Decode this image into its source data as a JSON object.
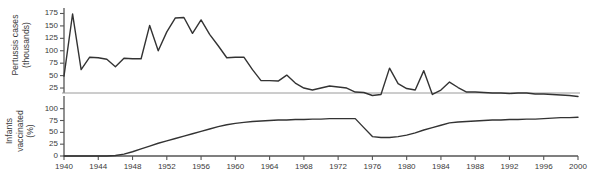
{
  "chart_data": {
    "type": "line",
    "title": "",
    "subtitle": "",
    "panels": [
      {
        "name": "pertussis-cases-panel",
        "ylabel_lines": [
          "Pertussis cases",
          "(thousands)"
        ],
        "ylabel": "Pertussis cases (thousands)",
        "yticks": [
          25,
          50,
          75,
          100,
          125,
          150,
          175
        ],
        "ytick_labels": [
          "25",
          "50",
          "75",
          "100",
          "125",
          "150",
          "175"
        ],
        "ylim": [
          15,
          180
        ],
        "grid": false,
        "series": [
          {
            "name": "Pertussis cases (thousands)",
            "x": [
              1940,
              1941,
              1942,
              1943,
              1944,
              1945,
              1946,
              1947,
              1948,
              1949,
              1950,
              1951,
              1952,
              1953,
              1954,
              1955,
              1956,
              1957,
              1958,
              1959,
              1960,
              1961,
              1962,
              1963,
              1964,
              1965,
              1966,
              1967,
              1968,
              1969,
              1970,
              1971,
              1972,
              1973,
              1974,
              1975,
              1976,
              1977,
              1978,
              1979,
              1980,
              1981,
              1982,
              1983,
              1984,
              1985,
              1986,
              1987,
              1988,
              1989,
              1990,
              1991,
              1992,
              1993,
              1994,
              1995,
              1996,
              1997,
              1998,
              1999,
              2000
            ],
            "values": [
              49,
              174,
              62,
              87,
              86,
              83,
              68,
              85,
              84,
              84,
              151,
              100,
              138,
              166,
              167,
              135,
              162,
              133,
              110,
              86,
              87,
              87,
              62,
              40,
              40,
              39,
              51,
              35,
              25,
              21,
              25,
              29,
              27,
              25,
              17,
              16,
              10,
              12,
              65,
              34,
              24,
              21,
              60,
              12,
              21,
              37,
              26,
              17,
              17,
              16,
              15,
              15,
              14,
              15,
              15,
              13,
              13,
              12,
              11,
              10,
              8
            ]
          }
        ]
      },
      {
        "name": "infants-vaccinated-panel",
        "ylabel_lines": [
          "Infants",
          "vaccinated",
          "(%)"
        ],
        "ylabel": "Infants vaccinated (%)",
        "yticks": [
          0,
          25,
          50,
          75,
          100
        ],
        "ytick_labels": [
          "0",
          "25",
          "50",
          "75",
          "100"
        ],
        "ylim": [
          0,
          112
        ],
        "grid": false,
        "series": [
          {
            "name": "Infants vaccinated (%)",
            "x": [
              1940,
              1941,
              1942,
              1943,
              1944,
              1945,
              1946,
              1947,
              1948,
              1949,
              1950,
              1951,
              1952,
              1953,
              1954,
              1955,
              1956,
              1957,
              1958,
              1959,
              1960,
              1961,
              1962,
              1963,
              1964,
              1965,
              1966,
              1967,
              1968,
              1969,
              1970,
              1971,
              1972,
              1973,
              1974,
              1975,
              1976,
              1977,
              1978,
              1979,
              1980,
              1981,
              1982,
              1983,
              1984,
              1985,
              1986,
              1987,
              1988,
              1989,
              1990,
              1991,
              1992,
              1993,
              1994,
              1995,
              1996,
              1997,
              1998,
              1999,
              2000
            ],
            "values": [
              0,
              0,
              0,
              0,
              0,
              0,
              1,
              4,
              9,
              15,
              21,
              27,
              32,
              37,
              42,
              47,
              52,
              57,
              62,
              66,
              69,
              71,
              73,
              74,
              75,
              76,
              76,
              77,
              77,
              78,
              78,
              79,
              79,
              79,
              79,
              60,
              41,
              39,
              39,
              41,
              44,
              49,
              55,
              60,
              65,
              70,
              72,
              73,
              74,
              75,
              76,
              76,
              77,
              77,
              78,
              78,
              79,
              80,
              81,
              81,
              82
            ]
          }
        ]
      }
    ],
    "xlabel": "",
    "x": [
      1940,
      1944,
      1948,
      1952,
      1956,
      1960,
      1964,
      1968,
      1972,
      1976,
      1980,
      1984,
      1988,
      1992,
      1996,
      2000
    ],
    "xtick_labels": [
      "1940",
      "1944",
      "1948",
      "1952",
      "1956",
      "1960",
      "1964",
      "1968",
      "1972",
      "1976",
      "1980",
      "1984",
      "1988",
      "1992",
      "1996",
      "2000"
    ],
    "xlim": [
      1940,
      2000
    ],
    "legend": [],
    "colors": {
      "line": "#333333",
      "axis": "#555555",
      "divider": "#9a9a9a",
      "background": "#ffffff",
      "text": "#3b3b3b"
    }
  }
}
